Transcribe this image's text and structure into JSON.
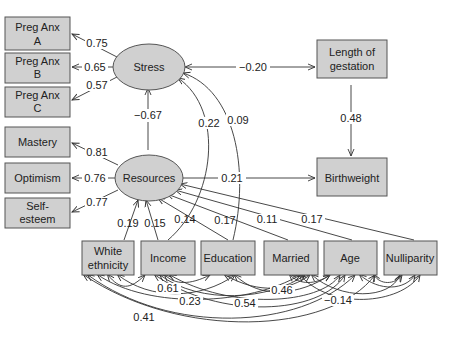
{
  "diagram": {
    "type": "structural-equation-model",
    "latent_variables": [
      {
        "id": "stress",
        "label": "Stress"
      },
      {
        "id": "resources",
        "label": "Resources"
      }
    ],
    "observed_variables": {
      "preg_anx_a": {
        "line1": "Preg Anx",
        "line2": "A"
      },
      "preg_anx_b": {
        "line1": "Preg Anx",
        "line2": "B"
      },
      "preg_anx_c": {
        "line1": "Preg Anx",
        "line2": "C"
      },
      "mastery": {
        "label": "Mastery"
      },
      "optimism": {
        "label": "Optimism"
      },
      "self_esteem": {
        "line1": "Self-",
        "line2": "esteem"
      },
      "length_of_gestation": {
        "line1": "Length of",
        "line2": "gestation"
      },
      "birthweight": {
        "label": "Birthweight"
      },
      "white_ethnicity": {
        "line1": "White",
        "line2": "ethnicity"
      },
      "income": {
        "label": "Income"
      },
      "education": {
        "label": "Education"
      },
      "married": {
        "label": "Married"
      },
      "age": {
        "label": "Age"
      },
      "nulliparity": {
        "label": "Nulliparity"
      }
    },
    "paths": {
      "stress_preg_anx_a": "0.75",
      "stress_preg_anx_b": "0.65",
      "stress_preg_anx_c": "0.57",
      "resources_mastery": "0.81",
      "resources_optimism": "0.76",
      "resources_self_esteem": "0.77",
      "resources_stress": "−0.67",
      "stress_gestation": "−0.20",
      "gestation_birthweight": "0.48",
      "resources_birthweight": "0.21",
      "income_stress": "0.22",
      "education_stress": "0.09",
      "white_resources": "0.19",
      "income_resources": "0.15",
      "education_resources": "0.14",
      "married_resources": "0.17",
      "age_resources": "0.11",
      "nulliparity_resources": "0.17"
    },
    "correlations": {
      "white_income": "0.61",
      "white_married": "0.23",
      "income_age": "0.54",
      "education_married": "0.46",
      "married_nulliparity": "−0.14",
      "white_age": "0.41"
    }
  }
}
